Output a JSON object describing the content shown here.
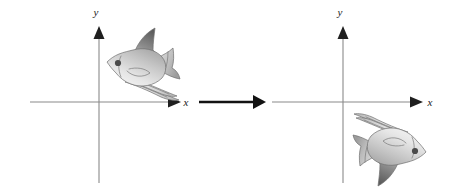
{
  "figure": {
    "background_color": "#ffffff",
    "width": 452,
    "height": 193
  },
  "panels": [
    {
      "id": "pre-image",
      "role": "pre-image",
      "origin": {
        "x": 99,
        "y": 102
      },
      "x_axis": {
        "label": "x",
        "label_x": 186,
        "label_y": 106,
        "start_x": 30,
        "end_x": 180,
        "y": 102
      },
      "y_axis": {
        "label": "y",
        "label_x": 96,
        "label_y": 16,
        "x": 99,
        "top_y": 27,
        "bottom_y": 183
      },
      "figure_object": {
        "name": "fish",
        "facing": "right",
        "rotation_deg": 0,
        "quadrant": "I",
        "center": {
          "x": 142,
          "y": 63
        },
        "bounds": {
          "x": 105,
          "y": 27,
          "width": 76,
          "height": 73
        }
      }
    },
    {
      "id": "image",
      "role": "image",
      "origin": {
        "x": 343,
        "y": 102
      },
      "x_axis": {
        "label": "x",
        "label_x": 430,
        "label_y": 106,
        "start_x": 272,
        "end_x": 422,
        "y": 102
      },
      "y_axis": {
        "label": "y",
        "label_x": 340,
        "label_y": 16,
        "x": 343,
        "top_y": 27,
        "bottom_y": 183
      },
      "figure_object": {
        "name": "fish",
        "facing": "left",
        "rotation_deg": 180,
        "quadrant": "IV",
        "center": {
          "x": 389,
          "y": 151
        },
        "bounds": {
          "x": 352,
          "y": 114,
          "width": 76,
          "height": 73
        }
      }
    }
  ],
  "transformation_arrow": {
    "name": "maps-to-arrow",
    "start_x": 199,
    "end_x": 266,
    "y": 102,
    "color": "#121212"
  },
  "colors": {
    "axis": "#8a8a8a",
    "axis_arrow": "#1f1f1f",
    "arrow": "#121212",
    "label": "#1a1a1a",
    "fish_body_light": "#f2f2f2",
    "fish_body_mid": "#c9c9c9",
    "fish_body_dark": "#9a9a9a",
    "fish_fin_dark": "#6e6e6e",
    "fish_fin_darker": "#4f4f4f",
    "fish_outline": "#6f6f6f",
    "fish_eye": "#4a4a4a"
  },
  "icons": {
    "x_axis_arrow": "arrow-right-icon",
    "y_axis_arrow": "arrow-up-icon",
    "map_arrow": "arrow-right-thick-icon",
    "fish": "fish-icon"
  }
}
